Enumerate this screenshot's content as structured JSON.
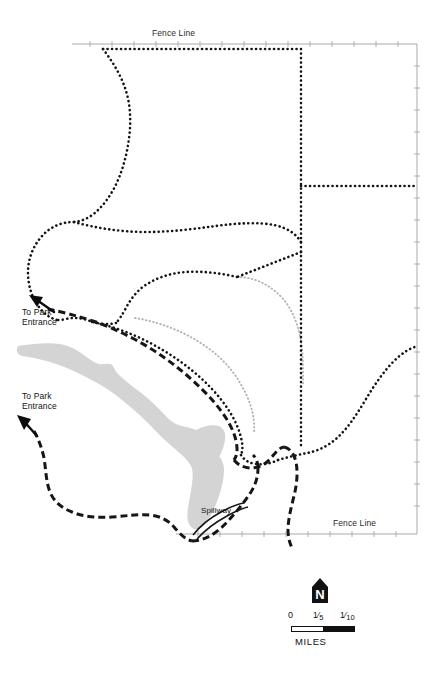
{
  "map": {
    "title": "Park Trail and Fence Line Map",
    "labels": {
      "fence_line_top": "Fence Line",
      "fence_line_bottom": "Fence Line",
      "to_park_entrance_upper": "To Park\nEntrance",
      "to_park_entrance_lower": "To Park\nEntrance",
      "spillway": "Spillway"
    },
    "legend": {
      "north_letter": "N",
      "scale_ticks": [
        "0",
        "1/5",
        "1/10"
      ],
      "scale_tick_parts": [
        {
          "whole": "0",
          "num": "",
          "den": ""
        },
        {
          "whole": "",
          "num": "1",
          "den": "5"
        },
        {
          "whole": "",
          "num": "1",
          "den": "10"
        }
      ],
      "units": "MILES"
    },
    "colors": {
      "background": "#ffffff",
      "trail_dark": "#1a1a1a",
      "trail_light": "#a8a8a8",
      "road_dash": "#171717",
      "water": "#d4d4d4",
      "fence_line": "#9a9a9a",
      "text": "#111111"
    },
    "features": {
      "water_body_name": "reservoir",
      "line_types": [
        "dotted-trail",
        "dashed-road",
        "thin-fence-line"
      ]
    }
  }
}
